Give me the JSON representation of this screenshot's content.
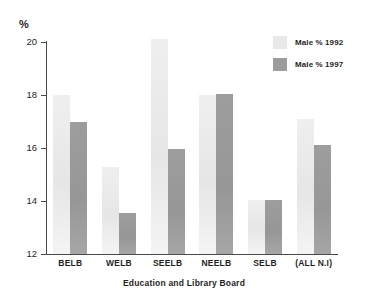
{
  "chart_data": {
    "type": "bar",
    "title": "",
    "subtitle": "",
    "xlabel": "Education and Library Board",
    "ylabel": "%",
    "ylim": [
      12,
      20
    ],
    "yticks": [
      12,
      14,
      16,
      18,
      20
    ],
    "ytick_labels": [
      "12",
      "14",
      "16",
      "18",
      "20"
    ],
    "grid": false,
    "legend_position": "top-right",
    "categories": [
      "BELB",
      "WELB",
      "SEELB",
      "NEELB",
      "SELB",
      "(ALL N.I)"
    ],
    "series": [
      {
        "name": "Male % 1992",
        "color": "#e9e9e9",
        "values": [
          18.0,
          15.3,
          20.1,
          18.0,
          14.05,
          17.1
        ]
      },
      {
        "name": "Male % 1997",
        "color": "#9b9b9b",
        "values": [
          17.0,
          13.55,
          15.95,
          18.05,
          14.05,
          16.1
        ]
      }
    ]
  },
  "axis": {
    "y_unit": "%"
  },
  "legend": {
    "items": [
      {
        "label": "Male % 1992"
      },
      {
        "label": "Male % 1997"
      }
    ]
  }
}
